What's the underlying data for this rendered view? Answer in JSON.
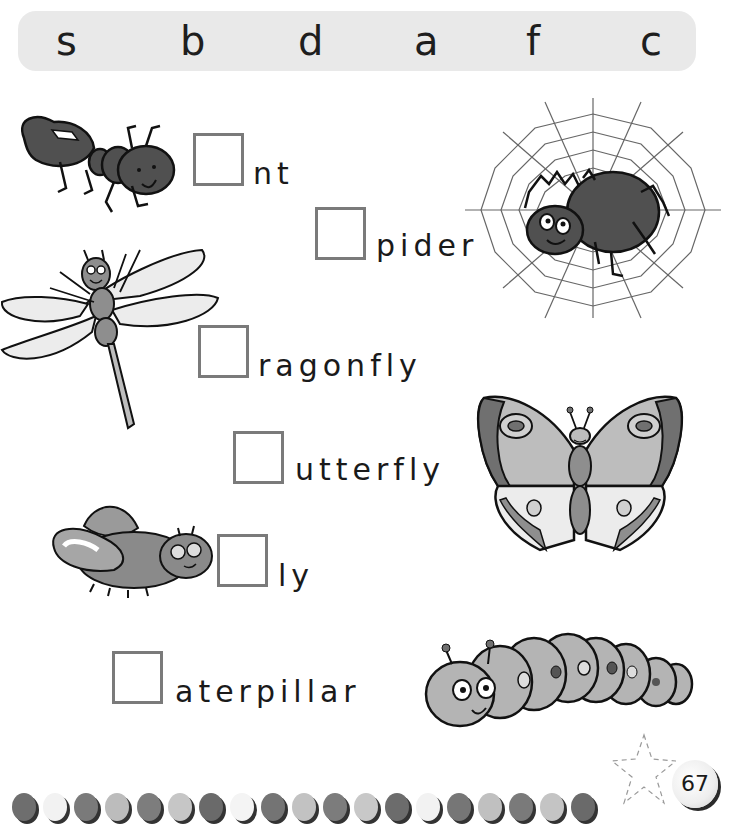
{
  "letter_bank": {
    "letters": [
      "s",
      "b",
      "d",
      "a",
      "f",
      "c"
    ]
  },
  "exercises": [
    {
      "animal": "ant",
      "missing_letter_box": "",
      "rest": "nt"
    },
    {
      "animal": "spider",
      "missing_letter_box": "",
      "rest": "pider"
    },
    {
      "animal": "dragonfly",
      "missing_letter_box": "",
      "rest": "ragonfly"
    },
    {
      "animal": "butterfly",
      "missing_letter_box": "",
      "rest": "utterfly"
    },
    {
      "animal": "fly",
      "missing_letter_box": "",
      "rest": "ly"
    },
    {
      "animal": "caterpillar",
      "missing_letter_box": "",
      "rest": "aterpillar"
    }
  ],
  "footer": {
    "page_number": "67",
    "dot_colors": [
      "#6e6e6e",
      "#f2f2f2",
      "#7a7a7a",
      "#bcbcbc",
      "#7d7d7d",
      "#c6c6c6",
      "#6a6a6a",
      "#f4f4f4",
      "#747474",
      "#c2c2c2",
      "#7c7c7c",
      "#c8c8c8",
      "#6c6c6c",
      "#f2f2f2",
      "#767676",
      "#c0c0c0",
      "#7a7a7a",
      "#c4c4c4",
      "#6a6a6a"
    ]
  },
  "colors": {
    "bank_bg": "#e9e9e9",
    "box_border": "#7a7a7a",
    "dark_insect": "#505050",
    "mid_insect": "#8e8e8e",
    "light_insect": "#bdbdbd"
  }
}
